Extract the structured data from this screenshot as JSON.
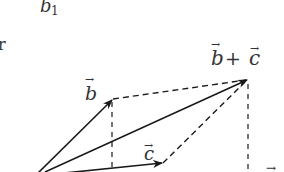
{
  "diagram": {
    "type": "vector-addition-parallelogram",
    "labels": {
      "top_partial": "b",
      "top_partial_sub": "1",
      "left_partial": "r",
      "vector_b": "b",
      "vector_c": "c",
      "vector_sum_b": "b",
      "vector_sum_plus": "+",
      "vector_sum_c": "c",
      "bottom_right_partial": "→"
    },
    "points": {
      "origin": [
        35,
        176
      ],
      "b_tip": [
        113,
        99
      ],
      "c_tip": [
        163,
        163
      ],
      "sum_tip": [
        248,
        79
      ]
    },
    "colors": {
      "stroke": "#1a1a1a",
      "text": "#333333",
      "background": "#ffffff"
    }
  }
}
